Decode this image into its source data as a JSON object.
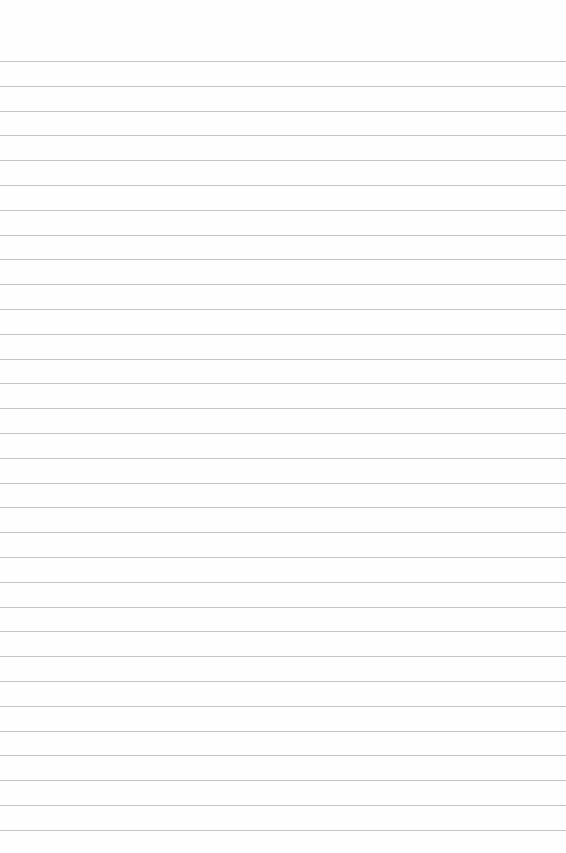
{
  "paper": {
    "type": "lined",
    "background": "#fefefe",
    "line_color": "#c4c4c4",
    "first_line_y": 61,
    "line_spacing": 24.8,
    "line_count": 32
  }
}
